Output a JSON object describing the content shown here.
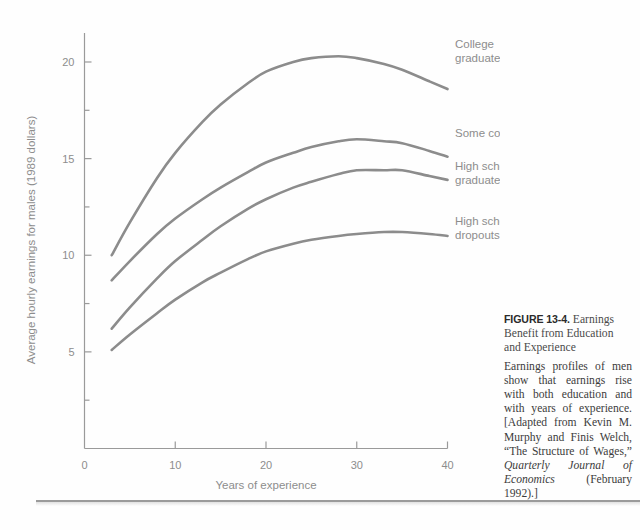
{
  "figure": {
    "number_label": "FIGURE 13-4.",
    "heading": " Earnings Benefit from Education and Experience",
    "caption_part1": "Earnings profiles of men show that earnings rise with both education and with years of experience. [Adapted from Kevin M. Murphy and Finis Welch, “The Structure of Wages,” ",
    "caption_italic": "Quarterly Journal of Economics",
    "caption_part2": " (February 1992).]"
  },
  "chart_data": {
    "type": "line",
    "title": "Earnings Benefit from Education and Experience",
    "xlabel": "Years of experience",
    "ylabel": "Average hourly earnings for males (1989 dollars)",
    "xlim": [
      0,
      40
    ],
    "ylim": [
      0,
      21.5
    ],
    "grid": false,
    "legend_position": "inline-right-end-labels",
    "x_ticks": [
      0,
      10,
      20,
      30,
      40
    ],
    "x_tick_labels": [
      "0",
      "10",
      "20",
      "30",
      "40"
    ],
    "x_minor_ticks": [
      5,
      15,
      25,
      35
    ],
    "y_ticks": [
      5,
      10,
      15,
      20
    ],
    "y_tick_labels": [
      "5",
      "10",
      "15",
      "20"
    ],
    "y_minor_ticks": [
      2.5,
      7.5,
      12.5,
      17.5
    ],
    "line_color": "#8c8c8c",
    "axis_color": "#9a9a9a",
    "text_color": "#8d8d8d",
    "x": [
      3,
      5,
      8,
      10,
      13,
      15,
      18,
      20,
      23,
      25,
      28,
      30,
      33,
      35,
      38,
      40
    ],
    "series": [
      {
        "name": "College graduates",
        "label": "College graduates",
        "values": [
          10.0,
          11.7,
          14.0,
          15.3,
          16.9,
          17.8,
          18.9,
          19.5,
          20.0,
          20.2,
          20.3,
          20.2,
          19.9,
          19.6,
          19.0,
          18.6
        ]
      },
      {
        "name": "Some college",
        "label": "Some college",
        "values": [
          8.7,
          9.7,
          11.1,
          11.9,
          12.9,
          13.5,
          14.3,
          14.8,
          15.3,
          15.6,
          15.9,
          16.0,
          15.9,
          15.8,
          15.4,
          15.1
        ]
      },
      {
        "name": "High school graduates",
        "label": "High school graduates",
        "values": [
          6.2,
          7.3,
          8.8,
          9.7,
          10.8,
          11.5,
          12.4,
          12.9,
          13.5,
          13.8,
          14.2,
          14.4,
          14.4,
          14.4,
          14.1,
          13.9
        ]
      },
      {
        "name": "High school dropouts",
        "label": "High school dropouts",
        "values": [
          5.1,
          5.9,
          7.0,
          7.7,
          8.6,
          9.1,
          9.8,
          10.2,
          10.6,
          10.8,
          11.0,
          11.1,
          11.2,
          11.2,
          11.1,
          11.0
        ]
      }
    ]
  }
}
